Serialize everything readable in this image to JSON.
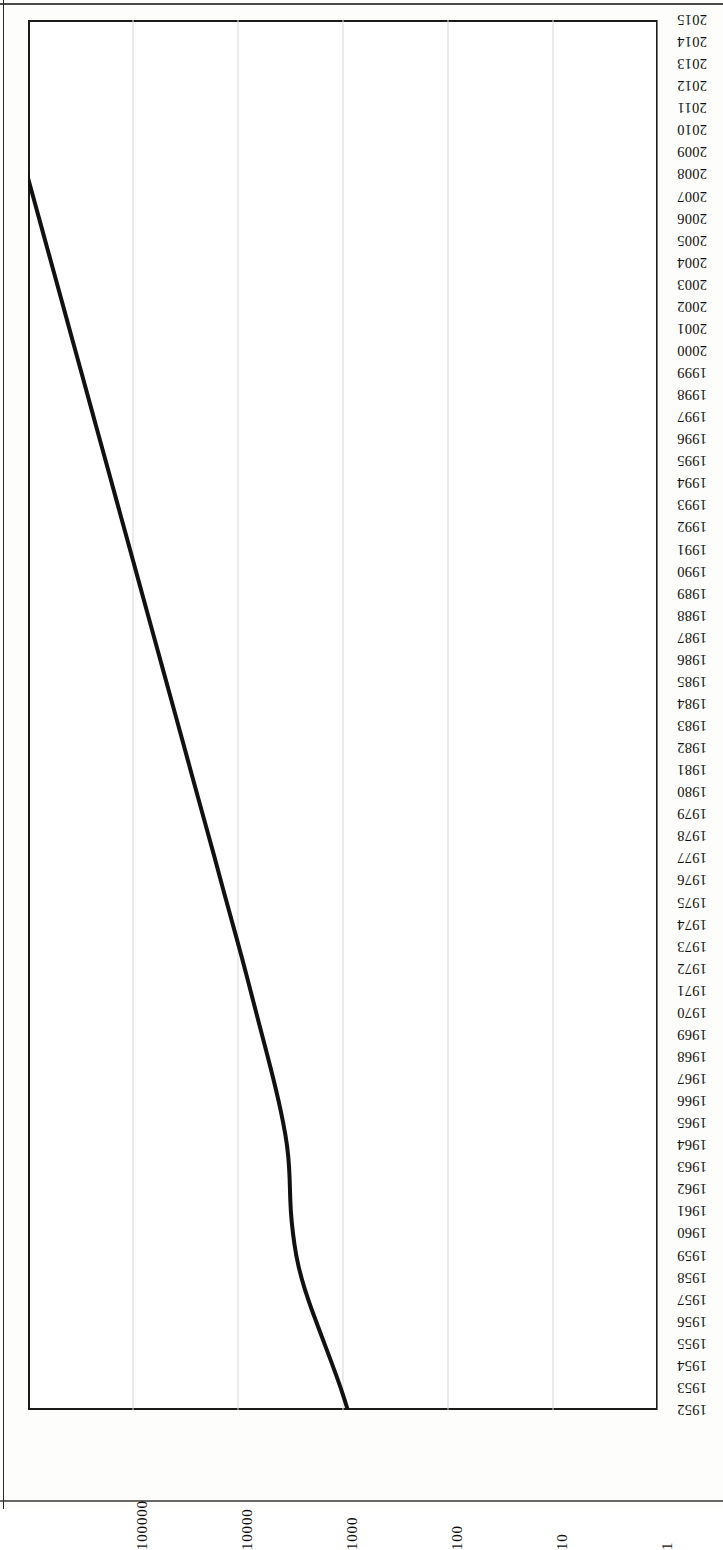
{
  "page": {
    "orientation": "rotated-90-scanned-page",
    "background_color": "#fdfdfc",
    "ink_color": "#121212"
  },
  "chart_data": {
    "type": "line",
    "title": "",
    "subtitle": "",
    "xlabel": "",
    "ylabel": "",
    "orientation": "rotated 90 degrees; year axis runs vertically (1952 bottom to 2015 top), value axis runs horizontally with values increasing right-to-left",
    "scale": "log",
    "grid": true,
    "grid_axis": "value",
    "legend": "none",
    "legend_position": "none",
    "line_color": "#111111",
    "line_width_px": 4,
    "value_axis": {
      "ticks": [
        "100000",
        "10000",
        "1000",
        "100",
        "10",
        "1"
      ],
      "tick_values": [
        100000,
        10000,
        1000,
        100,
        10,
        1
      ],
      "min": 1,
      "max": 1000000,
      "direction": "decreasing left-to-right"
    },
    "category_axis": {
      "label_top": "2015",
      "label_bottom": "1952",
      "ticks": [
        "2015",
        "2014",
        "2013",
        "2012",
        "2011",
        "2010",
        "2009",
        "2008",
        "2007",
        "2006",
        "2005",
        "2004",
        "2003",
        "2002",
        "2001",
        "2000",
        "1999",
        "1998",
        "1997",
        "1996",
        "1995",
        "1994",
        "1993",
        "1992",
        "1991",
        "1990",
        "1989",
        "1988",
        "1987",
        "1986",
        "1985",
        "1984",
        "1983",
        "1982",
        "1981",
        "1980",
        "1979",
        "1978",
        "1977",
        "1976",
        "1975",
        "1974",
        "1973",
        "1972",
        "1971",
        "1970",
        "1969",
        "1968",
        "1967",
        "1966",
        "1965",
        "1964",
        "1963",
        "1962",
        "1961",
        "1960",
        "1959",
        "1958",
        "1957",
        "1956",
        "1955",
        "1954",
        "1953",
        "1952"
      ]
    },
    "categories": [
      1952,
      1953,
      1954,
      1955,
      1956,
      1957,
      1958,
      1959,
      1960,
      1961,
      1962,
      1963,
      1964,
      1965,
      1966,
      1967,
      1968,
      1969,
      1970,
      1971,
      1972,
      1973,
      1974,
      1975,
      1976,
      1977,
      1978,
      1979,
      1980,
      1981,
      1982,
      1983,
      1984,
      1985,
      1986,
      1987,
      1988,
      1989,
      1990,
      1991,
      1992,
      1993,
      1994,
      1995,
      1996,
      1997,
      1998,
      1999,
      2000,
      2001,
      2002,
      2003,
      2004,
      2005,
      2006,
      2007,
      2008,
      2009,
      2010,
      2011,
      2012,
      2013,
      2014,
      2015
    ],
    "values": [
      900,
      1050,
      1250,
      1500,
      1800,
      2150,
      2500,
      2800,
      3000,
      3150,
      3200,
      3250,
      3400,
      3700,
      4100,
      4600,
      5200,
      5900,
      6700,
      7600,
      8600,
      9800,
      11200,
      12800,
      14600,
      16600,
      19000,
      21700,
      24800,
      28300,
      32300,
      36900,
      42100,
      48100,
      55000,
      62800,
      71700,
      81900,
      93500,
      106800,
      122000,
      139300,
      159100,
      181700,
      207500,
      237000,
      270700,
      309100,
      353000,
      403200,
      460500,
      525900,
      600600,
      685900,
      783300,
      894500,
      1021500,
      1166600,
      1332200,
      1521300,
      1737400,
      1984100,
      2265900,
      2587800
    ],
    "series": [
      {
        "name": "series-1",
        "values": [
          900,
          1050,
          1250,
          1500,
          1800,
          2150,
          2500,
          2800,
          3000,
          3150,
          3200,
          3250,
          3400,
          3700,
          4100,
          4600,
          5200,
          5900,
          6700,
          7600,
          8600,
          9800,
          11200,
          12800,
          14600,
          16600,
          19000,
          21700,
          24800,
          28300,
          32300,
          36900,
          42100,
          48100,
          55000,
          62800,
          71700,
          81900,
          93500,
          106800,
          122000,
          139300,
          159100,
          181700,
          207500,
          237000,
          270700,
          309100,
          353000,
          403200,
          460500,
          525900,
          600600,
          685900,
          783300,
          894500,
          1021500,
          1166600,
          1332200,
          1521300,
          1737400,
          1984100,
          2265900,
          2587800
        ]
      }
    ],
    "annotations": []
  }
}
